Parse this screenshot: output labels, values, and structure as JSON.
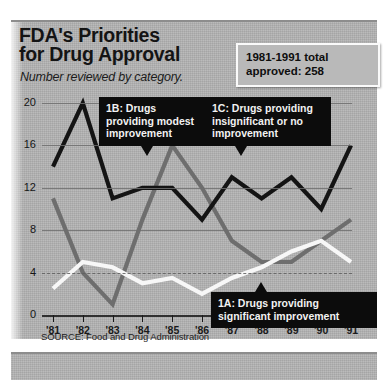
{
  "headline": {
    "line1": "FDA's Priorities",
    "line2": "for Drug Approval",
    "subtitle": "Number reviewed by category."
  },
  "total_box": {
    "line1": "1981-1991 total",
    "line2": "approved: 258"
  },
  "callouts": {
    "b": "1B: Drugs providing modest improvement",
    "c": "1C: Drugs providing insignificant or no improvement",
    "a": "1A: Drugs providing significant improvement"
  },
  "source": "SOURCE: Food and Drug Administration",
  "colors": {
    "panel_background": "#b3b3b3",
    "series_1a": "#f7f7f7",
    "series_1b": "#6e6e6e",
    "series_1c": "#141414",
    "callout_background": "#0c0c0c",
    "axis": "#1a1a1a"
  },
  "chart_data": {
    "type": "line",
    "title": "FDA's Priorities for Drug Approval",
    "subtitle": "Number reviewed by category.",
    "xlabel": "",
    "ylabel": "",
    "ylim": [
      0,
      20
    ],
    "yticks": [
      0,
      4,
      8,
      12,
      16,
      20
    ],
    "ytick_labels": [
      "0",
      "4",
      "8",
      "12",
      "16",
      "20"
    ],
    "grid": true,
    "legend": "annotations",
    "categories": [
      "'81",
      "'82",
      "'83",
      "'84",
      "'85",
      "'86",
      "'87",
      "'88",
      "'89",
      "'90",
      "'91"
    ],
    "x": [
      1981,
      1982,
      1983,
      1984,
      1985,
      1986,
      1987,
      1988,
      1989,
      1990,
      1991
    ],
    "series": [
      {
        "name": "1C: Drugs providing insignificant or no improvement",
        "color": "#141414",
        "values": [
          14,
          20,
          11,
          12,
          12,
          9,
          13,
          11,
          13,
          10,
          16
        ]
      },
      {
        "name": "1B: Drugs providing modest improvement",
        "color": "#6e6e6e",
        "values": [
          11,
          4,
          1,
          9,
          16,
          12,
          7,
          5,
          5,
          7,
          9
        ]
      },
      {
        "name": "1A: Drugs providing significant improvement",
        "color": "#f7f7f7",
        "values": [
          2.5,
          5,
          4.5,
          3,
          3.5,
          2,
          3.5,
          4.5,
          6,
          7,
          5
        ]
      }
    ],
    "annotations": [
      {
        "label": "1981-1991 total approved: 258"
      }
    ]
  }
}
